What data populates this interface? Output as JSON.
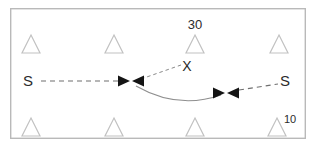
{
  "diagram": {
    "frame": {
      "x": 10,
      "y": 8,
      "width": 296,
      "height": 131,
      "stroke_color": "#b9b9b9"
    },
    "colors": {
      "triangle_stroke": "#c2c2c2",
      "dashed_line": "#6f6f6f",
      "arc_line": "#8f8f8f",
      "arrow_fill": "#141414",
      "text": "#2b2b2b"
    },
    "triangles": [
      {
        "name": "triangle-top-1",
        "cx": 31,
        "cy": 44,
        "size": 9
      },
      {
        "name": "triangle-top-2",
        "cx": 114,
        "cy": 44,
        "size": 9
      },
      {
        "name": "triangle-top-3",
        "cx": 195,
        "cy": 44,
        "size": 9
      },
      {
        "name": "triangle-top-4",
        "cx": 279,
        "cy": 44,
        "size": 9
      },
      {
        "name": "triangle-bottom-1",
        "cx": 31,
        "cy": 127,
        "size": 9
      },
      {
        "name": "triangle-bottom-2",
        "cx": 114,
        "cy": 127,
        "size": 9
      },
      {
        "name": "triangle-bottom-3",
        "cx": 195,
        "cy": 127,
        "size": 9
      },
      {
        "name": "triangle-bottom-4",
        "cx": 277,
        "cy": 127,
        "size": 9
      }
    ],
    "labels": {
      "source_left": "S",
      "source_right": "S",
      "node_marker": "X",
      "value_top": "30",
      "value_bottom": "10"
    },
    "label_positions": {
      "source_left": {
        "x": 28,
        "y": 86
      },
      "source_right": {
        "x": 283,
        "y": 86
      },
      "node_marker": {
        "x": 184,
        "y": 72
      },
      "value_top": {
        "x": 195,
        "y": 27
      },
      "value_bottom": {
        "x": 288,
        "y": 122
      }
    },
    "arrows": [
      {
        "name": "arrow-left-inbound",
        "direction": "right",
        "tip_x": 129,
        "tip_y": 81
      },
      {
        "name": "arrow-center-outbound",
        "direction": "left",
        "tip_x": 133,
        "tip_y": 81
      },
      {
        "name": "arrow-right-inbound",
        "direction": "right",
        "tip_x": 224,
        "tip_y": 93
      },
      {
        "name": "arrow-right-outbound",
        "direction": "left",
        "tip_x": 228,
        "tip_y": 93
      }
    ],
    "connectors": [
      {
        "name": "dashed-left-segment",
        "from_x": 40,
        "from_y": 81,
        "to_x": 119,
        "to_y": 81
      },
      {
        "name": "dashed-right-segment",
        "from_x": 238,
        "from_y": 90,
        "to_x": 277,
        "to_y": 84
      },
      {
        "name": "leader-line-x",
        "from_x": 140,
        "from_y": 79,
        "to_x": 180,
        "to_y": 65
      },
      {
        "name": "arc-center-to-right",
        "from_x": 136,
        "from_y": 86,
        "to_x": 222,
        "to_y": 94,
        "dip_y": 104
      }
    ]
  }
}
